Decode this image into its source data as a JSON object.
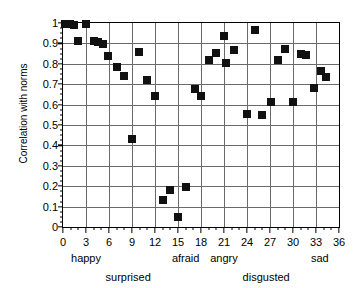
{
  "chart_data": {
    "type": "scatter",
    "title": "",
    "xlabel": "",
    "ylabel": "Correlation with norms",
    "xlim": [
      0,
      36
    ],
    "ylim": [
      0,
      1
    ],
    "grid": true,
    "legend": "none",
    "marker": "filled-square",
    "marker_color": "#111111",
    "x_major_step": 3,
    "x_minor_step": 1,
    "y_major_step": 0.1,
    "y_minor_step": 0.025,
    "xticks": [
      "0",
      "3",
      "6",
      "9",
      "12",
      "15",
      "18",
      "21",
      "24",
      "27",
      "30",
      "33",
      "36"
    ],
    "xtick_values": [
      0,
      3,
      6,
      9,
      12,
      15,
      18,
      21,
      24,
      27,
      30,
      33,
      36
    ],
    "yticks": [
      "0",
      "0.1",
      "0.2",
      "0.3",
      "0.4",
      "0.5",
      "0.6",
      "0.7",
      "0.8",
      "0.9",
      "1"
    ],
    "ytick_values": [
      0,
      0.1,
      0.2,
      0.3,
      0.4,
      0.5,
      0.6,
      0.7,
      0.8,
      0.9,
      1
    ],
    "group_labels": [
      {
        "label": "happy",
        "x": 3.0,
        "row": 1
      },
      {
        "label": "surprised",
        "x": 8.5,
        "row": 2
      },
      {
        "label": "afraid",
        "x": 16.0,
        "row": 1
      },
      {
        "label": "angry",
        "x": 21.0,
        "row": 1
      },
      {
        "label": "disgusted",
        "x": 26.5,
        "row": 2
      },
      {
        "label": "sad",
        "x": 33.5,
        "row": 1
      }
    ],
    "points": [
      {
        "x": 0.3,
        "y": 0.995
      },
      {
        "x": 0.9,
        "y": 0.995
      },
      {
        "x": 1.4,
        "y": 0.99
      },
      {
        "x": 2.0,
        "y": 0.91
      },
      {
        "x": 3.0,
        "y": 0.995
      },
      {
        "x": 4.0,
        "y": 0.91
      },
      {
        "x": 4.6,
        "y": 0.905
      },
      {
        "x": 5.2,
        "y": 0.895
      },
      {
        "x": 5.9,
        "y": 0.84
      },
      {
        "x": 7.0,
        "y": 0.785
      },
      {
        "x": 8.0,
        "y": 0.74
      },
      {
        "x": 9.0,
        "y": 0.43
      },
      {
        "x": 9.9,
        "y": 0.86
      },
      {
        "x": 10.9,
        "y": 0.72
      },
      {
        "x": 12.0,
        "y": 0.64
      },
      {
        "x": 13.0,
        "y": 0.13
      },
      {
        "x": 14.0,
        "y": 0.18
      },
      {
        "x": 15.0,
        "y": 0.05
      },
      {
        "x": 16.0,
        "y": 0.195
      },
      {
        "x": 17.2,
        "y": 0.675
      },
      {
        "x": 18.0,
        "y": 0.64
      },
      {
        "x": 19.0,
        "y": 0.82
      },
      {
        "x": 20.0,
        "y": 0.855
      },
      {
        "x": 21.0,
        "y": 0.935
      },
      {
        "x": 21.2,
        "y": 0.805
      },
      {
        "x": 22.3,
        "y": 0.87
      },
      {
        "x": 24.0,
        "y": 0.555
      },
      {
        "x": 25.0,
        "y": 0.965
      },
      {
        "x": 26.0,
        "y": 0.55
      },
      {
        "x": 27.1,
        "y": 0.615
      },
      {
        "x": 28.0,
        "y": 0.82
      },
      {
        "x": 29.0,
        "y": 0.875
      },
      {
        "x": 30.0,
        "y": 0.615
      },
      {
        "x": 31.0,
        "y": 0.85
      },
      {
        "x": 31.7,
        "y": 0.845
      },
      {
        "x": 32.8,
        "y": 0.68
      },
      {
        "x": 33.6,
        "y": 0.765
      },
      {
        "x": 34.3,
        "y": 0.735
      }
    ]
  }
}
